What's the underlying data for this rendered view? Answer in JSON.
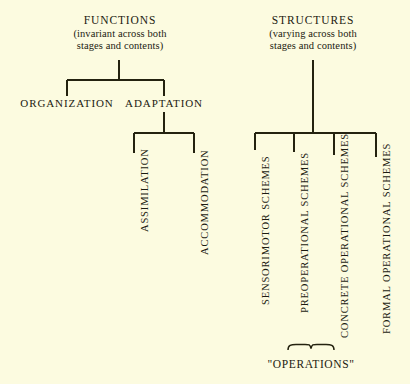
{
  "diagram": {
    "background_color": "#fcfbe0",
    "ink_color": "#24220f",
    "columns": {
      "functions": {
        "title": "FUNCTIONS",
        "subtitle_line1": "(invariant across both",
        "subtitle_line2": "stages and contents)",
        "children": [
          {
            "label": "ORGANIZATION",
            "orientation": "horizontal"
          },
          {
            "label": "ADAPTATION",
            "orientation": "horizontal"
          }
        ],
        "adaptation_children": [
          {
            "label": "ASSIMILATION",
            "orientation": "vertical"
          },
          {
            "label": "ACCOMMODATION",
            "orientation": "vertical"
          }
        ]
      },
      "structures": {
        "title": "STRUCTURES",
        "subtitle_line1": "(varying across both",
        "subtitle_line2": "stages and contents)",
        "children": [
          {
            "label": "SENSORIMOTOR SCHEMES",
            "orientation": "vertical"
          },
          {
            "label": "PREOPERATIONAL SCHEMES",
            "orientation": "vertical"
          },
          {
            "label": "CONCRETE OPERATIONAL SCHEMES",
            "orientation": "vertical"
          },
          {
            "label": "FORMAL OPERATIONAL SCHEMES",
            "orientation": "vertical"
          }
        ],
        "brace_group": {
          "label": "\"OPERATIONS\"",
          "covers": [
            "CONCRETE OPERATIONAL SCHEMES",
            "FORMAL OPERATIONAL SCHEMES"
          ]
        }
      }
    }
  }
}
